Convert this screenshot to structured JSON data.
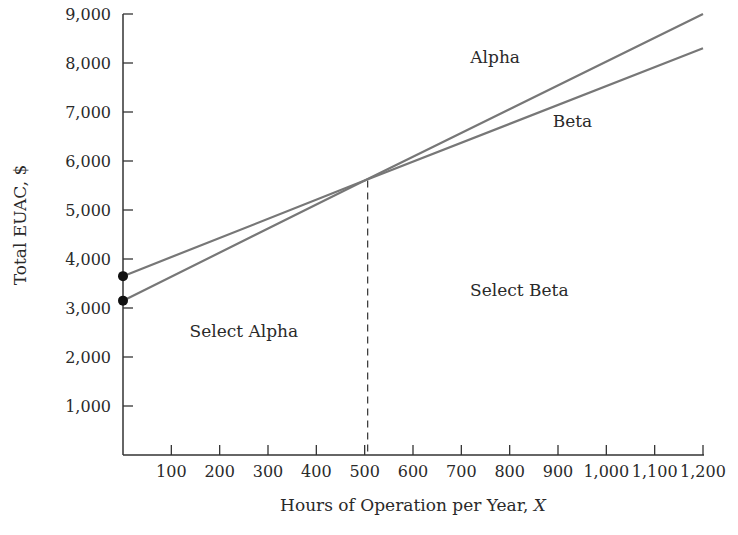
{
  "chart_data": {
    "type": "line",
    "title": "",
    "xlabel": "Hours of Operation per Year, X",
    "ylabel": "Total EUAC, $",
    "xlim": [
      0,
      1200
    ],
    "ylim": [
      0,
      9000
    ],
    "grid": false,
    "x_ticks": [
      100,
      200,
      300,
      400,
      500,
      600,
      700,
      800,
      900,
      1000,
      1100,
      1200
    ],
    "x_tick_labels": [
      "100",
      "200",
      "300",
      "400",
      "500",
      "600",
      "700",
      "800",
      "900",
      "1,000",
      "1,100",
      "1,200"
    ],
    "y_ticks": [
      1000,
      2000,
      3000,
      4000,
      5000,
      6000,
      7000,
      8000,
      9000
    ],
    "y_tick_labels": [
      "1,000",
      "2,000",
      "3,000",
      "4,000",
      "5,000",
      "6,000",
      "7,000",
      "8,000",
      "9,000"
    ],
    "series": [
      {
        "name": "Alpha",
        "x": [
          0,
          500,
          1200
        ],
        "values": [
          3150,
          5600,
          9000
        ],
        "start_marker": true
      },
      {
        "name": "Beta",
        "x": [
          0,
          500,
          1200
        ],
        "values": [
          3650,
          5600,
          8300
        ],
        "start_marker": true
      }
    ],
    "breakeven": {
      "x": 500,
      "y": 5600,
      "style": "dashed"
    },
    "annotations": [
      {
        "text": "Alpha",
        "x": 770,
        "y": 8000
      },
      {
        "text": "Beta",
        "x": 930,
        "y": 6700
      },
      {
        "text": "Select Alpha",
        "x": 250,
        "y": 2400
      },
      {
        "text": "Select Beta",
        "x": 820,
        "y": 3250
      }
    ],
    "line_color": "#777777"
  }
}
